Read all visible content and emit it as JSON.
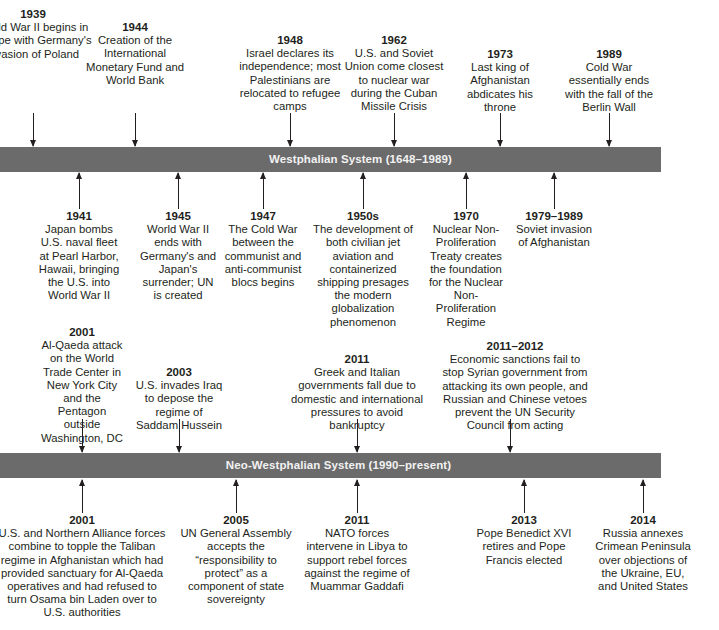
{
  "timeline": {
    "westphalian": {
      "bar_label": "Westphalian System (1648–1989)",
      "above": [
        {
          "year": "1939",
          "text": "World War II begins in Europe with Germany's invasion of Poland"
        },
        {
          "year": "1944",
          "text": "Creation of the International Monetary Fund and World Bank"
        },
        {
          "year": "1948",
          "text": "Israel declares its independence; most Palestinians are relocated to refugee camps"
        },
        {
          "year": "1962",
          "text": "U.S. and Soviet Union come closest to nuclear war during the Cuban Missile Crisis"
        },
        {
          "year": "1973",
          "text": "Last king of Afghanistan abdicates his throne"
        },
        {
          "year": "1989",
          "text": "Cold War essentially ends with the fall of the Berlin Wall"
        }
      ],
      "below": [
        {
          "year": "1941",
          "text": "Japan bombs U.S. naval fleet at Pearl Harbor, Hawaii, bringing the U.S. into World War II"
        },
        {
          "year": "1945",
          "text": "World War II ends with Germany's and Japan's surrender; UN is created"
        },
        {
          "year": "1947",
          "text": "The Cold War between the communist and anti-communist blocs begins"
        },
        {
          "year": "1950s",
          "text": "The development of both civilian jet aviation and containerized shipping presages the modern globalization phenomenon"
        },
        {
          "year": "1970",
          "text": "Nuclear Non-Proliferation Treaty creates the foundation for the Nuclear Non-Proliferation Regime"
        },
        {
          "year": "1979–1989",
          "text": "Soviet invasion of Afghanistan"
        }
      ]
    },
    "neo_westphalian": {
      "bar_label": "Neo-Westphalian System (1990–present)",
      "above": [
        {
          "year": "2001",
          "text": "Al-Qaeda attack on the World Trade Center in New York City and the Pentagon outside Washington, DC"
        },
        {
          "year": "2003",
          "text": "U.S. invades Iraq to depose the regime of Saddam Hussein"
        },
        {
          "year": "2011",
          "text": "Greek and Italian governments fall due to domestic and international pressures to avoid bankruptcy"
        },
        {
          "year": "2011–2012",
          "text": "Economic sanctions fail to stop Syrian government from attacking its own people, and Russian and Chinese vetoes prevent the UN Security Council from acting"
        }
      ],
      "below": [
        {
          "year": "2001",
          "text": "U.S. and Northern Alliance forces combine to topple the Taliban regime in Afghanistan which had provided sanctuary for Al-Qaeda operatives and had refused to turn Osama bin Laden over to U.S. authorities"
        },
        {
          "year": "2005",
          "text": "UN General Assembly accepts the “responsibility to protect” as a component of state sovereignty"
        },
        {
          "year": "2011",
          "text": "NATO forces intervene in Libya to support rebel forces against the regime of Muammar Gaddafi"
        },
        {
          "year": "2013",
          "text": "Pope Benedict XVI retires and Pope Francis elected"
        },
        {
          "year": "2014",
          "text": "Russia annexes Crimean Peninsula over objections of the Ukraine, EU, and United States"
        }
      ]
    }
  }
}
